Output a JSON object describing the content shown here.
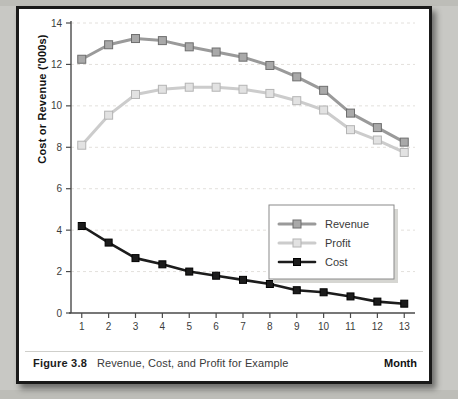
{
  "figure": {
    "number": "Figure 3.8",
    "caption": "Revenue, Cost, and Profit for Example",
    "xaxis_title": "Month",
    "yaxis_title": "Cost or Revenue ('000s)"
  },
  "colors": {
    "revenue": "#9a9a9a",
    "revenue_marker_fill": "#a9a9a9",
    "profit": "#cccccc",
    "profit_marker_fill": "#e2e2e2",
    "cost": "#1c1c1c",
    "grid": "#e3e0dc",
    "axis": "#4a4a4a",
    "frame": "#1a1a1a",
    "page_background": "#c8c8c4",
    "figure_background": "#ffffff"
  },
  "legend": {
    "position": "inside-right-middle",
    "entries": [
      {
        "label": "Revenue"
      },
      {
        "label": "Profit"
      },
      {
        "label": "Cost"
      }
    ]
  },
  "chart_data": {
    "type": "line",
    "title": "Revenue, Cost, and Profit for Example",
    "xlabel": "Month",
    "ylabel": "Cost or Revenue ('000s)",
    "x": [
      1,
      2,
      3,
      4,
      5,
      6,
      7,
      8,
      9,
      10,
      11,
      12,
      13
    ],
    "xticklabels": [
      "1",
      "2",
      "3",
      "4",
      "5",
      "6",
      "7",
      "8",
      "9",
      "10",
      "11",
      "12",
      "13"
    ],
    "yticks": [
      0,
      2,
      4,
      6,
      8,
      10,
      12,
      14
    ],
    "yticklabels": [
      "0",
      "2",
      "4",
      "6",
      "8",
      "10",
      "12",
      "14"
    ],
    "xlim": [
      0.6,
      13.4
    ],
    "ylim": [
      0,
      14
    ],
    "grid": true,
    "grid_axis": "y",
    "markers": "square",
    "series": [
      {
        "name": "Revenue",
        "values": [
          12.25,
          12.95,
          13.25,
          13.15,
          12.85,
          12.6,
          12.35,
          11.95,
          11.4,
          10.75,
          9.65,
          8.95,
          8.25
        ]
      },
      {
        "name": "Profit",
        "values": [
          8.1,
          9.55,
          10.55,
          10.8,
          10.9,
          10.9,
          10.8,
          10.6,
          10.25,
          9.8,
          8.85,
          8.35,
          7.75
        ]
      },
      {
        "name": "Cost",
        "values": [
          4.2,
          3.4,
          2.65,
          2.35,
          2.0,
          1.8,
          1.6,
          1.4,
          1.1,
          1.0,
          0.8,
          0.55,
          0.45
        ]
      }
    ]
  }
}
